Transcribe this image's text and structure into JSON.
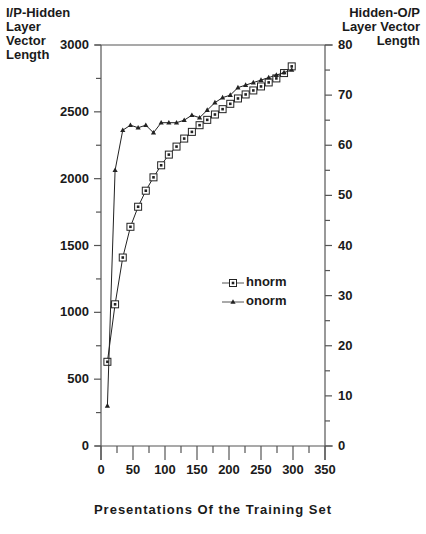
{
  "chart_data": {
    "type": "line",
    "title": "",
    "xlabel": "Presentations Of the Training Set",
    "ylabel_left": "I/P-Hidden Layer Vector Length",
    "ylabel_right": "Hidden-O/P Layer Vector Length",
    "xlim": [
      0,
      350
    ],
    "ylim_left": [
      0,
      3000
    ],
    "ylim_right": [
      0,
      80
    ],
    "x_ticks": [
      0,
      50,
      100,
      150,
      200,
      250,
      300,
      350
    ],
    "y_ticks_left": [
      0,
      500,
      1000,
      1500,
      2000,
      2500,
      3000
    ],
    "y_ticks_right": [
      0,
      10,
      20,
      30,
      40,
      50,
      60,
      70,
      80
    ],
    "grid": false,
    "legend_position": "center-right inside plot",
    "x": [
      10,
      22,
      34,
      46,
      58,
      70,
      82,
      94,
      106,
      118,
      130,
      142,
      154,
      166,
      178,
      190,
      202,
      214,
      226,
      238,
      250,
      262,
      274,
      286,
      298
    ],
    "series": [
      {
        "name": "hnorm",
        "axis": "left",
        "marker": "square-with-dot",
        "values": [
          630,
          1060,
          1410,
          1640,
          1790,
          1910,
          2010,
          2100,
          2180,
          2240,
          2300,
          2350,
          2400,
          2440,
          2480,
          2520,
          2560,
          2600,
          2630,
          2660,
          2690,
          2720,
          2750,
          2790,
          2840
        ]
      },
      {
        "name": "onorm",
        "axis": "right",
        "marker": "triangle",
        "values": [
          8,
          55,
          63,
          64,
          63.5,
          64,
          62.5,
          64.5,
          64.5,
          64.5,
          65,
          66,
          65.5,
          67,
          68.5,
          69.5,
          70,
          71.5,
          72,
          72.5,
          73,
          73.5,
          74,
          74.5,
          75
        ]
      }
    ]
  },
  "labels": {
    "ylabel_left_lines": [
      "I/P-Hidden",
      "Layer",
      "Vector",
      "Length"
    ],
    "ylabel_right_lines": [
      "Hidden-O/P",
      "Layer Vector",
      "Length"
    ],
    "xtitle": "Presentations Of the Training Set",
    "legend": [
      "hnorm",
      "onorm"
    ]
  },
  "colors": {
    "axis": "#555555",
    "line": "#222222"
  }
}
